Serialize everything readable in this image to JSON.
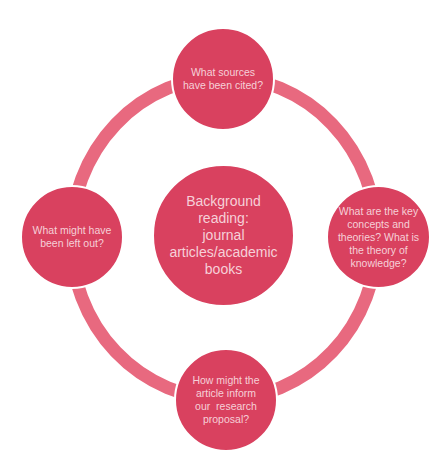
{
  "diagram": {
    "type": "cycle",
    "colors": {
      "node_fill": "#d9415f",
      "ring": "#e8697f",
      "text": "#f6d0d8",
      "background": "#ffffff"
    },
    "center": {
      "label": "Background reading: journal articles/academic books",
      "lines": [
        "Background",
        "reading:",
        "journal",
        "articles/academic",
        "books"
      ]
    },
    "nodes": [
      {
        "position": "top",
        "label": "What sources have been cited?",
        "lines": [
          "What sources",
          "have been cited?"
        ]
      },
      {
        "position": "right",
        "label": "What are the key concepts and theories? What is the theory of knowledge?",
        "lines": [
          "What are the key",
          "concepts and",
          "theories? What is",
          "the theory of",
          "knowledge?"
        ]
      },
      {
        "position": "bottom",
        "label": "How might the article inform our research proposal?",
        "lines": [
          "How might the",
          "article inform",
          "our  research",
          "proposal?"
        ]
      },
      {
        "position": "left",
        "label": "What might have been left out?",
        "lines": [
          "What might have",
          "been left out?"
        ]
      }
    ]
  }
}
